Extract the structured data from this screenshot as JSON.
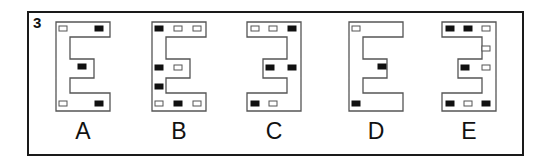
{
  "question": {
    "number": "3"
  },
  "colors": {
    "outline": "#555555",
    "filled": "#111111",
    "open_fill": "#ffffff",
    "frame": "#1a1a1a"
  },
  "figures": [
    {
      "label": "A",
      "shape": "E",
      "left": 55,
      "squares": [
        {
          "x": 4,
          "y": 5,
          "filled": false
        },
        {
          "x": 40,
          "y": 5,
          "filled": true
        },
        {
          "x": 23,
          "y": 43,
          "filled": true
        },
        {
          "x": 4,
          "y": 80,
          "filled": false
        },
        {
          "x": 40,
          "y": 80,
          "filled": true
        }
      ]
    },
    {
      "label": "B",
      "shape": "E",
      "left": 151,
      "squares": [
        {
          "x": 4,
          "y": 5,
          "filled": true
        },
        {
          "x": 23,
          "y": 5,
          "filled": false
        },
        {
          "x": 42,
          "y": 5,
          "filled": false
        },
        {
          "x": 4,
          "y": 44,
          "filled": true
        },
        {
          "x": 23,
          "y": 44,
          "filled": false
        },
        {
          "x": 4,
          "y": 63,
          "filled": true
        },
        {
          "x": 4,
          "y": 80,
          "filled": false
        },
        {
          "x": 23,
          "y": 80,
          "filled": true
        },
        {
          "x": 42,
          "y": 80,
          "filled": false
        }
      ]
    },
    {
      "label": "C",
      "shape": "3",
      "left": 246,
      "squares": [
        {
          "x": 5,
          "y": 5,
          "filled": false
        },
        {
          "x": 23,
          "y": 5,
          "filled": false
        },
        {
          "x": 42,
          "y": 5,
          "filled": true
        },
        {
          "x": 20,
          "y": 44,
          "filled": true
        },
        {
          "x": 42,
          "y": 44,
          "filled": true
        },
        {
          "x": 5,
          "y": 80,
          "filled": true
        },
        {
          "x": 23,
          "y": 80,
          "filled": false
        }
      ]
    },
    {
      "label": "D",
      "shape": "E",
      "left": 348,
      "squares": [
        {
          "x": 4,
          "y": 5,
          "filled": false
        },
        {
          "x": 30,
          "y": 43,
          "filled": true
        },
        {
          "x": 4,
          "y": 80,
          "filled": true
        }
      ]
    },
    {
      "label": "E",
      "shape": "3",
      "left": 441,
      "squares": [
        {
          "x": 5,
          "y": 5,
          "filled": true
        },
        {
          "x": 23,
          "y": 5,
          "filled": true
        },
        {
          "x": 41,
          "y": 5,
          "filled": false
        },
        {
          "x": 41,
          "y": 25,
          "filled": false
        },
        {
          "x": 20,
          "y": 44,
          "filled": true
        },
        {
          "x": 41,
          "y": 44,
          "filled": false
        },
        {
          "x": 5,
          "y": 80,
          "filled": true
        },
        {
          "x": 23,
          "y": 80,
          "filled": false
        },
        {
          "x": 41,
          "y": 80,
          "filled": true
        }
      ]
    }
  ]
}
